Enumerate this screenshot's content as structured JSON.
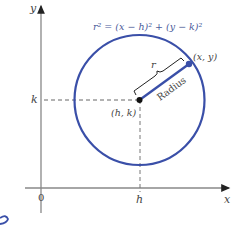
{
  "diagram": {
    "equation": "r² = (x − h)² + (y − k)²",
    "axes": {
      "x_label": "x",
      "y_label": "y",
      "origin_label": "0",
      "h_label": "h",
      "k_label": "k"
    },
    "center_label": "(h, k)",
    "point_label": "(x, y)",
    "radius_text": "Radius",
    "r_label": "r",
    "colors": {
      "circle": "#3a4fa8",
      "axes": "#777777",
      "dashed": "#666666",
      "text": "#444444"
    }
  }
}
